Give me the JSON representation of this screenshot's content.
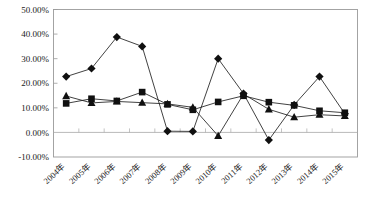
{
  "chart_data": {
    "type": "line",
    "title": "",
    "subtitle": "",
    "xlabel": "",
    "ylabel": "",
    "categories": [
      "2004年",
      "2005年",
      "2006年",
      "2007年",
      "2008年",
      "2009年",
      "2010年",
      "2011年",
      "2012年",
      "2013年",
      "2014年",
      "2015年"
    ],
    "ytick_labels": [
      "50.00%",
      "40.00%",
      "30.00%",
      "20.00%",
      "10.00%",
      "0.00%",
      "-10.00%"
    ],
    "ytick_values": [
      50,
      40,
      30,
      20,
      10,
      0,
      -10
    ],
    "ylim": [
      -10,
      50
    ],
    "grid": false,
    "legend": "none",
    "value_suffix": "%",
    "series": [
      {
        "name": "series-diamond",
        "marker": "diamond",
        "color": "#101010",
        "values": [
          22.7,
          26.0,
          38.8,
          35.0,
          0.5,
          0.4,
          30.0,
          15.8,
          -3.1,
          11.2,
          22.7,
          7.6
        ]
      },
      {
        "name": "series-square",
        "marker": "square",
        "color": "#101010",
        "values": [
          11.8,
          13.7,
          12.8,
          16.4,
          11.4,
          9.2,
          12.4,
          14.9,
          12.3,
          11.0,
          8.8,
          8.0
        ]
      },
      {
        "name": "series-triangle",
        "marker": "triangle",
        "color": "#101010",
        "values": [
          14.8,
          12.0,
          12.6,
          12.1,
          11.6,
          10.2,
          -1.4,
          15.6,
          9.4,
          6.2,
          7.2,
          6.7
        ]
      }
    ]
  },
  "axes": {
    "y_axis_name": "percent-axis",
    "x_axis_name": "year-axis"
  }
}
